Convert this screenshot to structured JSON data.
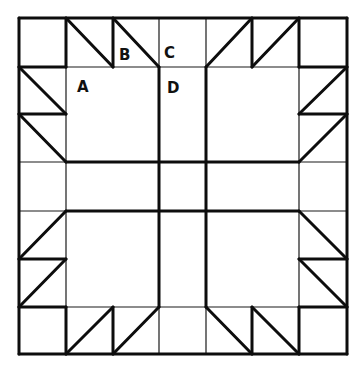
{
  "diagram": {
    "colors": {
      "background": "#ffffff",
      "line": "#111111"
    },
    "grid": {
      "x": [
        19,
        66,
        113,
        159,
        206,
        252,
        299,
        347
      ],
      "y": [
        18,
        67,
        114,
        162,
        211,
        259,
        307,
        354
      ]
    },
    "labels": [
      {
        "text": "A",
        "x": 77,
        "y": 92
      },
      {
        "text": "B",
        "x": 119,
        "y": 60
      },
      {
        "text": "C",
        "x": 164,
        "y": 58
      },
      {
        "text": "D",
        "x": 167,
        "y": 93
      }
    ],
    "thin_lines": [
      [
        19,
        67,
        347,
        67
      ],
      [
        19,
        307,
        347,
        307
      ],
      [
        66,
        18,
        66,
        354
      ],
      [
        299,
        18,
        299,
        354
      ],
      [
        113,
        18,
        113,
        67
      ],
      [
        252,
        18,
        252,
        67
      ],
      [
        113,
        307,
        113,
        354
      ],
      [
        252,
        307,
        252,
        354
      ],
      [
        19,
        114,
        66,
        114
      ],
      [
        299,
        114,
        347,
        114
      ],
      [
        19,
        259,
        66,
        259
      ],
      [
        299,
        259,
        347,
        259
      ],
      [
        159,
        18,
        159,
        67
      ],
      [
        206,
        18,
        206,
        67
      ],
      [
        159,
        307,
        159,
        354
      ],
      [
        206,
        307,
        206,
        354
      ],
      [
        19,
        162,
        66,
        162
      ],
      [
        19,
        211,
        66,
        211
      ],
      [
        299,
        162,
        347,
        162
      ],
      [
        299,
        211,
        347,
        211
      ],
      [
        159,
        162,
        206,
        162
      ],
      [
        159,
        211,
        206,
        211
      ]
    ],
    "thick_lines": [
      [
        19,
        18,
        347,
        18
      ],
      [
        347,
        18,
        347,
        354
      ],
      [
        347,
        354,
        19,
        354
      ],
      [
        19,
        354,
        19,
        18
      ],
      [
        66,
        18,
        66,
        67
      ],
      [
        19,
        67,
        66,
        67
      ],
      [
        66,
        18,
        113,
        67
      ],
      [
        113,
        18,
        113,
        67
      ],
      [
        113,
        18,
        159,
        67
      ],
      [
        19,
        67,
        66,
        114
      ],
      [
        19,
        114,
        66,
        114
      ],
      [
        19,
        114,
        66,
        162
      ],
      [
        252,
        18,
        206,
        67
      ],
      [
        252,
        18,
        252,
        67
      ],
      [
        299,
        18,
        252,
        67
      ],
      [
        299,
        18,
        299,
        67
      ],
      [
        299,
        67,
        347,
        67
      ],
      [
        347,
        67,
        299,
        114
      ],
      [
        299,
        114,
        347,
        114
      ],
      [
        347,
        114,
        299,
        162
      ],
      [
        19,
        259,
        66,
        211
      ],
      [
        19,
        259,
        66,
        259
      ],
      [
        19,
        307,
        66,
        259
      ],
      [
        19,
        307,
        66,
        307
      ],
      [
        66,
        307,
        66,
        354
      ],
      [
        66,
        354,
        113,
        307
      ],
      [
        113,
        307,
        113,
        354
      ],
      [
        113,
        354,
        159,
        307
      ],
      [
        206,
        307,
        252,
        354
      ],
      [
        252,
        307,
        252,
        354
      ],
      [
        252,
        307,
        299,
        354
      ],
      [
        299,
        307,
        299,
        354
      ],
      [
        299,
        307,
        347,
        307
      ],
      [
        299,
        211,
        347,
        259
      ],
      [
        299,
        259,
        347,
        259
      ],
      [
        299,
        259,
        347,
        307
      ],
      [
        66,
        162,
        299,
        162
      ],
      [
        66,
        211,
        299,
        211
      ],
      [
        159,
        67,
        159,
        307
      ],
      [
        206,
        67,
        206,
        307
      ]
    ]
  }
}
